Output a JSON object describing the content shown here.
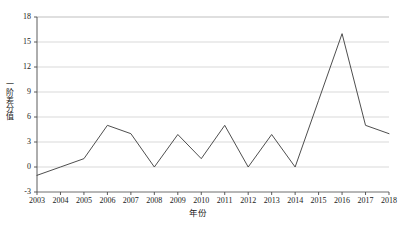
{
  "chart_data": {
    "type": "line",
    "title": "",
    "xlabel": "年份",
    "ylabel": "一阶差分值",
    "categories": [
      "2003",
      "2004",
      "2005",
      "2006",
      "2007",
      "2008",
      "2009",
      "2010",
      "2011",
      "2012",
      "2013",
      "2014",
      "2015",
      "2016",
      "2017",
      "2018"
    ],
    "x": [
      2003,
      2004,
      2005,
      2006,
      2007,
      2008,
      2009,
      2010,
      2011,
      2012,
      2013,
      2014,
      2015,
      2016,
      2017,
      2018
    ],
    "values": [
      -1,
      0,
      1,
      5,
      4,
      0,
      3.9,
      1,
      5,
      0,
      3.9,
      0,
      8,
      16,
      5,
      4
    ],
    "series": [
      {
        "name": "一阶差分值",
        "values": [
          -1,
          0,
          1,
          5,
          4,
          0,
          3.9,
          1,
          5,
          0,
          3.9,
          0,
          8,
          16,
          5,
          4
        ],
        "color": "#3a3a3a"
      }
    ],
    "ylim": [
      -3,
      18
    ],
    "xlim": [
      2003,
      2018
    ],
    "yticks": [
      18,
      15,
      12,
      9,
      6,
      3,
      0,
      -3
    ],
    "ytick_labels": [
      "18",
      "15",
      "12",
      "9",
      "6",
      "3",
      "0",
      "-3"
    ],
    "xticks": [
      2003,
      2004,
      2005,
      2006,
      2007,
      2008,
      2009,
      2010,
      2011,
      2012,
      2013,
      2014,
      2015,
      2016,
      2017,
      2018
    ],
    "xtick_labels": [
      "2003",
      "2004",
      "2005",
      "2006",
      "2007",
      "2008",
      "2009",
      "2010",
      "2011",
      "2012",
      "2013",
      "2014",
      "2015",
      "2016",
      "2017",
      "2018"
    ],
    "grid": "horizontal",
    "grid_color": "#c8c8c8",
    "legend": "none",
    "line_color": "#3a3a3a",
    "axis_color": "#4a4a4a",
    "background": "#ffffff"
  }
}
